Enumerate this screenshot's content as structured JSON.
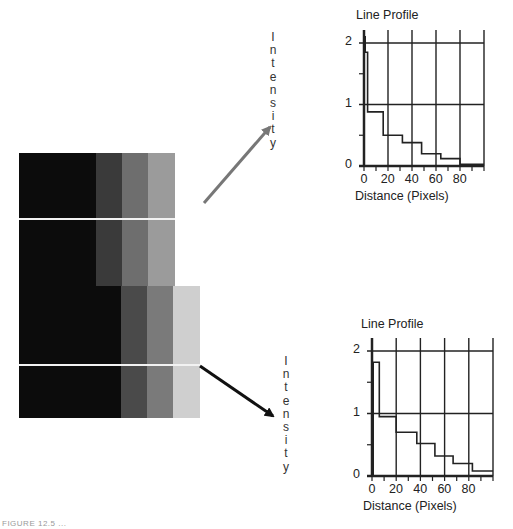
{
  "image": {
    "upper_block": {
      "x": 19,
      "y": 153,
      "width": 156,
      "height": 133,
      "columns": [
        {
          "x": 19,
          "w": 77,
          "color": "#0c0c0c"
        },
        {
          "x": 96,
          "w": 26,
          "color": "#3a3a3a"
        },
        {
          "x": 122,
          "w": 26,
          "color": "#6e6e6e"
        },
        {
          "x": 148,
          "w": 27,
          "color": "#9b9b9b"
        }
      ],
      "scanline_y": 218
    },
    "lower_block": {
      "x": 19,
      "y": 286,
      "width": 181,
      "height": 132,
      "columns": [
        {
          "x": 19,
          "w": 102,
          "color": "#0c0c0c"
        },
        {
          "x": 121,
          "w": 26,
          "color": "#4a4a4a"
        },
        {
          "x": 147,
          "w": 26,
          "color": "#7a7a7a"
        },
        {
          "x": 173,
          "w": 27,
          "color": "#cfcfcf"
        }
      ],
      "scanline_y": 364
    }
  },
  "arrows": {
    "top": {
      "x1": 204,
      "y1": 203,
      "x2": 270,
      "y2": 127,
      "color": "#777777"
    },
    "bottom": {
      "x1": 200,
      "y1": 366,
      "x2": 273,
      "y2": 416,
      "color": "#111111"
    }
  },
  "labels": {
    "intensity_top_letters": [
      "I",
      "n",
      "t",
      "e",
      "n",
      "s",
      "i",
      "t",
      "y"
    ],
    "intensity_bottom_letters": [
      "I",
      "n",
      "t",
      "e",
      "n",
      "s",
      "i",
      "t",
      "y"
    ],
    "caption": "FIGURE 12.5 ..."
  },
  "chart_data": [
    {
      "type": "line",
      "title": "Line Profile",
      "xlabel": "Distance (Pixels)",
      "ylabel": "Intensity",
      "xlim": [
        0,
        100
      ],
      "ylim": [
        0,
        2.2
      ],
      "x_ticks": [
        0,
        20,
        40,
        60,
        80
      ],
      "y_ticks": [
        0,
        1,
        2
      ],
      "grid": true,
      "series": [
        {
          "name": "upper scan line",
          "x": [
            0,
            1,
            1,
            3,
            3,
            16,
            16,
            32,
            32,
            48,
            48,
            64,
            64,
            80,
            80,
            100
          ],
          "y": [
            2.1,
            2.1,
            1.85,
            1.85,
            0.88,
            0.88,
            0.5,
            0.5,
            0.38,
            0.38,
            0.2,
            0.2,
            0.12,
            0.12,
            0.03,
            0.03
          ]
        }
      ]
    },
    {
      "type": "line",
      "title": "Line Profile",
      "xlabel": "Distance (Pixels)",
      "ylabel": "Intensity",
      "xlim": [
        0,
        100
      ],
      "ylim": [
        0,
        2.2
      ],
      "x_ticks": [
        0,
        20,
        40,
        60,
        80
      ],
      "y_ticks": [
        0,
        1,
        2
      ],
      "grid": true,
      "series": [
        {
          "name": "lower scan line",
          "x": [
            1,
            1,
            6,
            6,
            20,
            20,
            37,
            37,
            52,
            52,
            67,
            67,
            83,
            83,
            100
          ],
          "y": [
            0,
            1.82,
            1.82,
            0.95,
            0.95,
            0.7,
            0.7,
            0.52,
            0.52,
            0.32,
            0.32,
            0.2,
            0.2,
            0.08,
            0.08
          ]
        }
      ]
    }
  ],
  "charts_layout": [
    {
      "origin_x": 364,
      "origin_y": 166,
      "px_per_x": 1.2,
      "px_per_y": 61.5,
      "top_y": 30,
      "title_x": 356,
      "title_y": 8
    },
    {
      "origin_x": 372,
      "origin_y": 476,
      "px_per_x": 1.21,
      "px_per_y": 62.5,
      "top_y": 338,
      "title_x": 361,
      "title_y": 317
    }
  ]
}
